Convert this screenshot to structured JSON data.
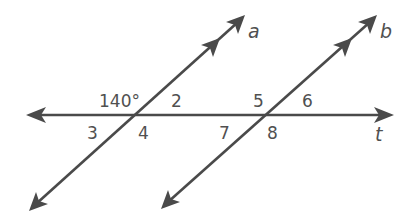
{
  "diagram": {
    "lines": {
      "a": {
        "label": "a"
      },
      "b": {
        "label": "b"
      },
      "t": {
        "label": "t"
      }
    },
    "angles": {
      "angle1": "140°",
      "angle2": "2",
      "angle3": "3",
      "angle4": "4",
      "angle5": "5",
      "angle6": "6",
      "angle7": "7",
      "angle8": "8"
    },
    "colors": {
      "line": "#4a4a4a",
      "text": "#505050",
      "background": "#ffffff"
    }
  }
}
